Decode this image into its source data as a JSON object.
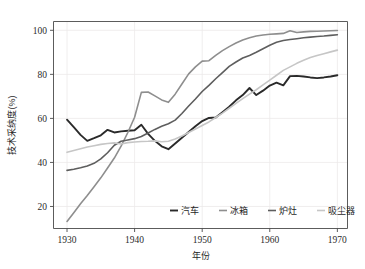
{
  "chart_data": {
    "type": "line",
    "title": "",
    "xlabel": "年份",
    "ylabel": "技术采纳度(%)",
    "xlim": [
      1928,
      1971.5
    ],
    "ylim": [
      10,
      104
    ],
    "xticks": [
      1930,
      1940,
      1950,
      1960,
      1970
    ],
    "xtick_labels": [
      "1930",
      "1940",
      "1950",
      "1960",
      "1970"
    ],
    "yticks": [
      20,
      40,
      60,
      80,
      100
    ],
    "ytick_labels": [
      "20",
      "40",
      "60",
      "80",
      "100"
    ],
    "grid": true,
    "legend_position": "lower-right-inside",
    "x": [
      1930,
      1931,
      1932,
      1933,
      1934,
      1935,
      1936,
      1937,
      1938,
      1939,
      1940,
      1941,
      1942,
      1943,
      1944,
      1945,
      1946,
      1947,
      1948,
      1949,
      1950,
      1951,
      1952,
      1953,
      1954,
      1955,
      1956,
      1957,
      1958,
      1959,
      1960,
      1961,
      1962,
      1963,
      1964,
      1965,
      1966,
      1967,
      1968,
      1969,
      1970
    ],
    "series": [
      {
        "name": "汽车",
        "color": "#2a2a2a",
        "width": 1.9,
        "values": [
          59.4,
          56.0,
          52.5,
          49.8,
          51.0,
          52.3,
          54.8,
          53.6,
          54.1,
          54.4,
          54.6,
          57.1,
          53.0,
          49.8,
          47.3,
          46.0,
          48.6,
          51.2,
          53.8,
          56.4,
          58.8,
          60.2,
          60.4,
          62.8,
          65.3,
          68.2,
          70.6,
          73.8,
          70.6,
          72.6,
          74.9,
          76.2,
          75.0,
          79.2,
          79.3,
          79.0,
          78.6,
          78.3,
          78.6,
          79.0,
          79.6
        ]
      },
      {
        "name": "冰箱",
        "color": "#8e8e8e",
        "width": 1.6,
        "values": [
          13.2,
          17.2,
          21.2,
          25.0,
          29.0,
          33.0,
          37.5,
          42.0,
          47.4,
          53.6,
          60.5,
          71.8,
          72.0,
          70.2,
          68.4,
          67.3,
          71.0,
          75.6,
          80.2,
          83.4,
          86.0,
          86.2,
          88.6,
          90.8,
          92.6,
          94.2,
          95.6,
          96.6,
          97.4,
          97.9,
          98.2,
          98.4,
          98.6,
          99.8,
          99.0,
          99.3,
          99.5,
          99.6,
          99.7,
          99.8,
          99.9
        ]
      },
      {
        "name": "炉灶",
        "color": "#5e5e5e",
        "width": 1.6,
        "values": [
          36.4,
          36.9,
          37.6,
          38.4,
          39.6,
          41.6,
          44.4,
          47.8,
          49.6,
          50.2,
          50.8,
          51.8,
          53.4,
          55.0,
          56.4,
          57.6,
          59.2,
          62.2,
          65.6,
          68.8,
          72.2,
          75.0,
          78.0,
          80.8,
          83.6,
          85.6,
          87.4,
          88.6,
          90.0,
          91.6,
          93.2,
          94.6,
          95.4,
          95.8,
          96.2,
          96.6,
          96.9,
          97.2,
          97.4,
          97.7,
          98.0
        ]
      },
      {
        "name": "吸尘器",
        "color": "#c6c6c6",
        "width": 1.6,
        "values": [
          44.6,
          45.4,
          46.2,
          47.0,
          47.6,
          48.2,
          48.6,
          48.9,
          48.4,
          49.0,
          49.3,
          49.5,
          49.6,
          49.8,
          49.4,
          49.6,
          50.6,
          52.0,
          53.6,
          55.2,
          56.8,
          58.4,
          60.4,
          62.4,
          64.6,
          66.8,
          69.0,
          71.0,
          73.0,
          75.2,
          77.4,
          79.6,
          81.8,
          83.4,
          85.0,
          86.4,
          87.6,
          88.6,
          89.4,
          90.2,
          91.0
        ]
      }
    ],
    "legend": [
      {
        "label": "汽车",
        "color": "#2a2a2a"
      },
      {
        "label": "冰箱",
        "color": "#8e8e8e"
      },
      {
        "label": "炉灶",
        "color": "#5e5e5e"
      },
      {
        "label": "吸尘器",
        "color": "#c6c6c6"
      }
    ],
    "colors": {
      "axis": "#4a4a4a",
      "grid": "#eceaea",
      "background": "#ffffff",
      "text": "#1f1f1f"
    }
  }
}
